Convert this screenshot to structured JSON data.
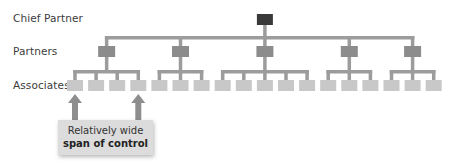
{
  "levels": {
    "chief": "Chief Partner",
    "partners": "Partners",
    "associates": "Associates"
  },
  "structure": {
    "chief_partner_count": 1,
    "partner_count": 5,
    "associates_per_partner": [
      4,
      3,
      5,
      3,
      3
    ],
    "highlighted_associates": [
      0,
      3
    ]
  },
  "callout": {
    "line1": "Relatively wide",
    "line2": "span of control"
  },
  "colors": {
    "chief_box": "#3a3a3a",
    "partner_box": "#8c8c8c",
    "associate_box": "#c8c8c8",
    "connector": "#9c9c9c",
    "arrow": "#8e8e8e",
    "callout_bg": "#dcdcdc"
  }
}
